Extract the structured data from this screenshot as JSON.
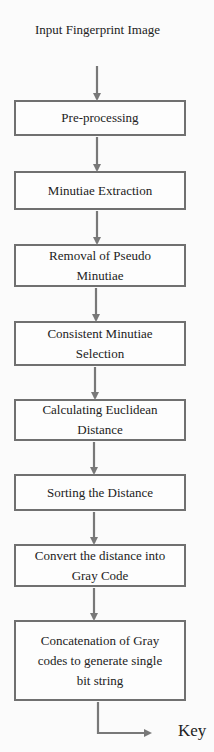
{
  "diagram": {
    "type": "flowchart",
    "direction": "top-to-bottom",
    "start": {
      "label": "Input Fingerprint Image"
    },
    "steps": [
      {
        "label": "Pre-processing"
      },
      {
        "label": "Minutiae Extraction"
      },
      {
        "label": "Removal of Pseudo Minutiae"
      },
      {
        "label": "Consistent Minutiae Selection"
      },
      {
        "label": "Calculating Euclidean Distance"
      },
      {
        "label": "Sorting the Distance"
      },
      {
        "label": "Convert the distance into Gray Code"
      },
      {
        "label": "Concatenation of Gray codes to generate single bit string"
      }
    ],
    "end": {
      "label": "Key"
    },
    "colors": {
      "box_border": "#707070",
      "arrow": "#787878",
      "text": "#222222",
      "background": "#fbfbfb"
    }
  }
}
